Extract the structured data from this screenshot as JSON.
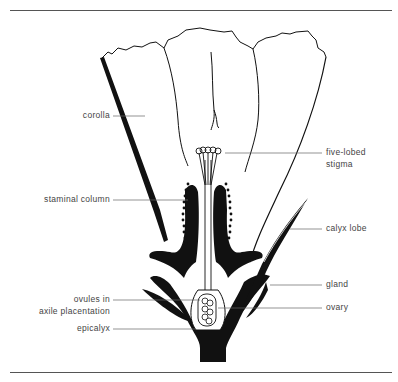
{
  "figure": {
    "labels": {
      "corolla": "corolla",
      "staminal_column": "staminal column",
      "ovules_line1": "ovules in",
      "ovules_line2": "axile placentation",
      "epicalyx": "epicalyx",
      "stigma_line1": "five-lobed",
      "stigma_line2": "stigma",
      "calyx_lobe": "calyx lobe",
      "gland": "gland",
      "ovary": "ovary"
    }
  },
  "colors": {
    "ink": "#111111",
    "label_text": "#444444",
    "leader_line": "#666666",
    "background": "#ffffff"
  }
}
